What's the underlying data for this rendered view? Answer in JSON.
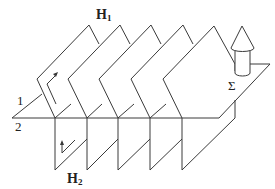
{
  "figure": {
    "labels": {
      "h1_main": "H",
      "h1_sub": "1",
      "h2_main": "H",
      "h2_sub": "2",
      "surface_1": "1",
      "surface_2": "2",
      "sigma": "Σ"
    },
    "colors": {
      "line": "#3a3a3a",
      "background": "#ffffff"
    },
    "elements": [
      "base-line-2",
      "surface-line-1",
      "upper-half-planes-H1 (5 slanted sheets)",
      "lower-half-planes-H2 (5 vertical sheets)",
      "surface-sigma",
      "cylinder-with-cone",
      "orientation-arrow-upper",
      "orientation-arrow-lower"
    ]
  }
}
